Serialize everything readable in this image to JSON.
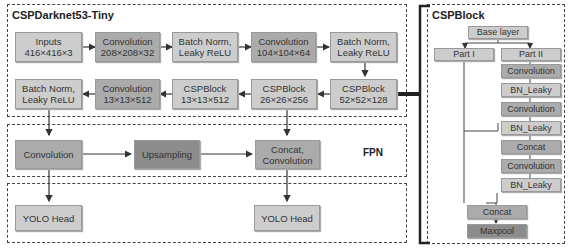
{
  "left_panel": {
    "title": "CSPDarknet53-Tiny",
    "row1": [
      {
        "line1": "Inputs",
        "line2": "416×416×3"
      },
      {
        "line1": "Convolution",
        "line2": "208×208×32"
      },
      {
        "line1": "Batch Norm,",
        "line2": "Leaky ReLU"
      },
      {
        "line1": "Convolution",
        "line2": "104×104×64"
      },
      {
        "line1": "Batch Norm,",
        "line2": "Leaky ReLU"
      }
    ],
    "row2": [
      {
        "line1": "Batch Norm,",
        "line2": "Leaky ReLU"
      },
      {
        "line1": "Convolution",
        "line2": "13×13×512"
      },
      {
        "line1": "CSPBlock",
        "line2": "13×13×512"
      },
      {
        "line1": "CSPBlock",
        "line2": "26×26×256"
      },
      {
        "line1": "CSPBlock",
        "line2": "52×52×128"
      }
    ]
  },
  "fpn": {
    "label": "FPN",
    "convolution": "Convolution",
    "upsampling": "Upsampling",
    "concat_line1": "Concat,",
    "concat_line2": "Convolution"
  },
  "heads": {
    "head1": "YOLO Head",
    "head2": "YOLO Head"
  },
  "csp_block": {
    "title": "CSPBlock",
    "base_layer": "Base layer",
    "part1": "Part I",
    "part2": "Part II",
    "part2_layers": [
      "Convolution",
      "BN_Leaky",
      "Convolution",
      "BN_Leaky",
      "Concat",
      "Convolution",
      "BN_Leaky"
    ],
    "concat": "Concat",
    "maxpool": "Maxpool"
  },
  "colors": {
    "light_box": "#cdcdcd",
    "mid_box": "#ababab",
    "dark_box": "#8c8c8c",
    "line": "#333333"
  }
}
